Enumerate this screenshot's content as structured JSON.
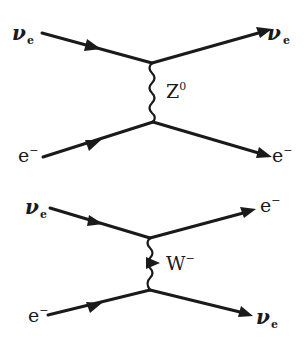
{
  "diagrams": [
    {
      "name": "neutral-current",
      "incoming_top": {
        "symbol": "ν",
        "sub": "e"
      },
      "incoming_bottom": {
        "symbol": "e",
        "sup": "−"
      },
      "outgoing_top": {
        "symbol": "ν",
        "sub": "e"
      },
      "outgoing_bottom": {
        "symbol": "e",
        "sup": "−"
      },
      "boson": {
        "symbol": "Z",
        "sup": "0"
      }
    },
    {
      "name": "charged-current",
      "incoming_top": {
        "symbol": "ν",
        "sub": "e"
      },
      "incoming_bottom": {
        "symbol": "e",
        "sup": "−"
      },
      "outgoing_top": {
        "symbol": "e",
        "sup": "−"
      },
      "outgoing_bottom": {
        "symbol": "ν",
        "sub": "e"
      },
      "boson": {
        "symbol": "W",
        "sup": "−"
      }
    }
  ],
  "colors": {
    "ink": "#1a1a1a",
    "background": "#ffffff"
  }
}
